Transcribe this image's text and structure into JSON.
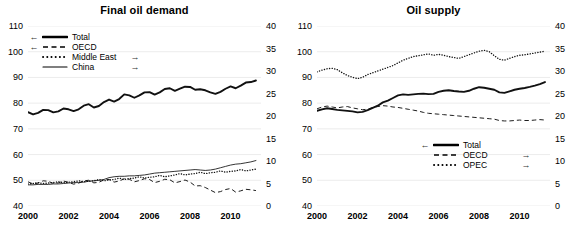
{
  "figure": {
    "panels": [
      "demand",
      "supply"
    ]
  },
  "demand": {
    "title": "Final oil demand",
    "axis_left": {
      "ticks": [
        40,
        50,
        60,
        70,
        80,
        90,
        100,
        110
      ],
      "min": 40,
      "max": 110
    },
    "axis_right": {
      "ticks": [
        0,
        5,
        10,
        15,
        20,
        25,
        30,
        35,
        40
      ],
      "min": 0,
      "max": 40
    },
    "axis_x": {
      "ticks": [
        "2000",
        "2002",
        "2004",
        "2006",
        "2008",
        "2010"
      ],
      "min": 2000,
      "max": 2011.5
    },
    "legend": [
      {
        "label": "Total",
        "style": "thick-solid",
        "arrow_left": "←",
        "arrow_right": ""
      },
      {
        "label": "OECD",
        "style": "dashed",
        "arrow_left": "←",
        "arrow_right": ""
      },
      {
        "label": "Middle East",
        "style": "dotted",
        "arrow_left": "",
        "arrow_right": "→"
      },
      {
        "label": "China",
        "style": "thin-solid",
        "arrow_left": "",
        "arrow_right": "→"
      }
    ]
  },
  "supply": {
    "title": "Oil supply",
    "axis_left": {
      "ticks": [
        40,
        50,
        60,
        70,
        80,
        90,
        100,
        110
      ],
      "min": 40,
      "max": 110
    },
    "axis_right": {
      "ticks": [
        0,
        5,
        10,
        15,
        20,
        25,
        30,
        35,
        40
      ],
      "min": 0,
      "max": 40
    },
    "axis_x": {
      "ticks": [
        "2000",
        "2002",
        "2004",
        "2006",
        "2008",
        "2010"
      ],
      "min": 2000,
      "max": 2011.5
    },
    "legend": [
      {
        "label": "Total",
        "style": "thick-solid",
        "arrow_left": "←",
        "arrow_right": ""
      },
      {
        "label": "OECD",
        "style": "dashed",
        "arrow_left": "",
        "arrow_right": "→"
      },
      {
        "label": "OPEC",
        "style": "dotted",
        "arrow_left": "",
        "arrow_right": "→"
      }
    ]
  },
  "chart_data": [
    {
      "type": "line",
      "title": "Final oil demand",
      "xlabel": "",
      "ylabel": "",
      "ylim": [
        40,
        110
      ],
      "ylim_right": [
        0,
        40
      ],
      "grid": true,
      "legend_position": "upper-left",
      "x": [
        2000,
        2000.25,
        2000.5,
        2000.75,
        2001,
        2001.25,
        2001.5,
        2001.75,
        2002,
        2002.25,
        2002.5,
        2002.75,
        2003,
        2003.25,
        2003.5,
        2003.75,
        2004,
        2004.25,
        2004.5,
        2004.75,
        2005,
        2005.25,
        2005.5,
        2005.75,
        2006,
        2006.25,
        2006.5,
        2006.75,
        2007,
        2007.25,
        2007.5,
        2007.75,
        2008,
        2008.25,
        2008.5,
        2008.75,
        2009,
        2009.25,
        2009.5,
        2009.75,
        2010,
        2010.25,
        2010.5,
        2010.75,
        2011,
        2011.25
      ],
      "series": [
        {
          "name": "Total",
          "axis": "left",
          "style": "thick-solid",
          "values": [
            76.5,
            75.6,
            76.2,
            77.4,
            77.3,
            76.4,
            76.8,
            77.9,
            77.6,
            76.9,
            77.6,
            79.0,
            79.6,
            78.3,
            78.9,
            80.4,
            81.4,
            80.6,
            81.6,
            83.4,
            83.0,
            82.1,
            83.0,
            84.2,
            84.3,
            83.3,
            84.2,
            85.5,
            85.8,
            84.8,
            85.6,
            86.4,
            86.3,
            85.2,
            85.4,
            85.0,
            84.2,
            83.6,
            84.4,
            85.6,
            86.5,
            85.8,
            86.8,
            88.0,
            88.2,
            88.8
          ]
        },
        {
          "name": "OECD",
          "axis": "left",
          "style": "dashed",
          "values": [
            49.4,
            48.6,
            48.9,
            49.8,
            49.6,
            48.8,
            49.0,
            49.7,
            49.2,
            48.5,
            48.9,
            49.8,
            50.0,
            49.0,
            49.2,
            50.2,
            50.3,
            49.3,
            49.7,
            50.6,
            50.4,
            49.4,
            49.9,
            50.6,
            50.3,
            49.1,
            49.6,
            50.4,
            50.2,
            49.0,
            49.5,
            50.1,
            49.3,
            47.8,
            47.9,
            47.2,
            46.2,
            45.2,
            45.6,
            46.4,
            46.8,
            45.4,
            45.9,
            46.5,
            46.3,
            46.0
          ]
        },
        {
          "name": "Middle East",
          "axis": "right",
          "style": "dotted",
          "values": [
            4.9,
            5.0,
            5.2,
            5.0,
            5.1,
            5.2,
            5.4,
            5.2,
            5.3,
            5.4,
            5.6,
            5.4,
            5.5,
            5.6,
            5.9,
            5.6,
            5.8,
            5.9,
            6.2,
            5.9,
            6.1,
            6.2,
            6.5,
            6.2,
            6.4,
            6.5,
            6.8,
            6.5,
            6.7,
            6.9,
            7.2,
            6.9,
            7.1,
            7.2,
            7.5,
            7.2,
            7.4,
            7.5,
            7.8,
            7.5,
            7.7,
            7.8,
            8.1,
            7.8,
            8.0,
            8.2
          ]
        },
        {
          "name": "China",
          "axis": "right",
          "style": "thin-solid",
          "values": [
            4.7,
            4.7,
            4.8,
            4.8,
            4.8,
            4.9,
            4.9,
            5.0,
            5.1,
            5.2,
            5.2,
            5.3,
            5.5,
            5.6,
            5.7,
            5.9,
            6.3,
            6.5,
            6.6,
            6.6,
            6.7,
            6.7,
            6.8,
            6.9,
            7.1,
            7.3,
            7.4,
            7.5,
            7.6,
            7.7,
            7.8,
            7.9,
            8.0,
            8.1,
            8.0,
            7.9,
            8.0,
            8.2,
            8.5,
            8.8,
            9.1,
            9.3,
            9.4,
            9.6,
            9.8,
            10.1
          ]
        }
      ]
    },
    {
      "type": "line",
      "title": "Oil supply",
      "xlabel": "",
      "ylabel": "",
      "ylim": [
        40,
        110
      ],
      "ylim_right": [
        0,
        40
      ],
      "grid": true,
      "legend_position": "lower-center",
      "x": [
        2000,
        2000.25,
        2000.5,
        2000.75,
        2001,
        2001.25,
        2001.5,
        2001.75,
        2002,
        2002.25,
        2002.5,
        2002.75,
        2003,
        2003.25,
        2003.5,
        2003.75,
        2004,
        2004.25,
        2004.5,
        2004.75,
        2005,
        2005.25,
        2005.5,
        2005.75,
        2006,
        2006.25,
        2006.5,
        2006.75,
        2007,
        2007.25,
        2007.5,
        2007.75,
        2008,
        2008.25,
        2008.5,
        2008.75,
        2009,
        2009.25,
        2009.5,
        2009.75,
        2010,
        2010.25,
        2010.5,
        2010.75,
        2011,
        2011.25
      ],
      "series": [
        {
          "name": "Total",
          "axis": "left",
          "style": "thick-solid",
          "values": [
            77.0,
            77.6,
            78.0,
            77.7,
            77.4,
            77.2,
            77.0,
            76.8,
            76.4,
            76.6,
            77.3,
            78.2,
            79.0,
            80.3,
            81.0,
            82.0,
            83.0,
            83.4,
            83.2,
            83.4,
            83.6,
            83.7,
            83.5,
            83.6,
            84.4,
            84.8,
            85.0,
            84.7,
            84.5,
            84.4,
            84.8,
            85.6,
            86.2,
            86.0,
            85.6,
            85.2,
            84.2,
            84.0,
            84.6,
            85.2,
            85.6,
            85.9,
            86.3,
            86.8,
            87.4,
            88.2
          ]
        },
        {
          "name": "OECD",
          "axis": "right",
          "style": "dashed",
          "values": [
            21.6,
            22.0,
            22.2,
            22.0,
            21.8,
            22.0,
            22.1,
            21.8,
            21.6,
            21.4,
            21.5,
            21.9,
            22.1,
            22.3,
            22.2,
            22.0,
            21.9,
            21.7,
            21.5,
            21.3,
            21.1,
            20.8,
            20.6,
            20.5,
            20.4,
            20.3,
            20.2,
            20.1,
            20.0,
            19.9,
            19.8,
            19.7,
            19.6,
            19.5,
            19.4,
            19.3,
            19.0,
            18.9,
            18.9,
            19.0,
            19.1,
            19.0,
            19.0,
            19.1,
            19.2,
            19.1
          ]
        },
        {
          "name": "OPEC",
          "axis": "right",
          "style": "dotted",
          "values": [
            29.8,
            30.2,
            30.5,
            30.6,
            30.3,
            29.6,
            29.0,
            28.6,
            28.3,
            28.6,
            29.2,
            29.6,
            30.0,
            30.4,
            30.8,
            31.2,
            31.8,
            32.4,
            32.8,
            33.2,
            33.4,
            33.6,
            33.8,
            33.5,
            33.7,
            33.5,
            33.2,
            33.0,
            32.8,
            33.2,
            33.6,
            34.0,
            34.4,
            34.6,
            34.3,
            33.4,
            32.6,
            32.4,
            32.8,
            33.2,
            33.5,
            33.6,
            33.8,
            34.0,
            34.2,
            34.4
          ]
        }
      ]
    }
  ]
}
